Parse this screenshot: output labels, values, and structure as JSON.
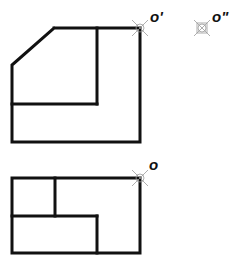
{
  "drawing": {
    "type": "orthographic-projection",
    "views": [
      {
        "name": "front-view",
        "description": "chamfered L-shaped block elevation"
      },
      {
        "name": "top-view",
        "description": "rectangular plan with internal step lines"
      }
    ],
    "points": {
      "front_view_point": "o'",
      "side_view_point": "o\"",
      "top_view_point": "o"
    },
    "colors": {
      "line": "#111111",
      "marker": "#9a9a9a",
      "background": "#ffffff"
    }
  }
}
